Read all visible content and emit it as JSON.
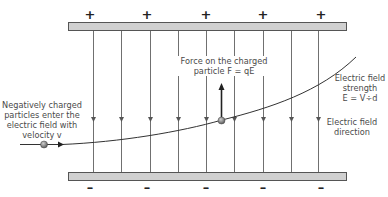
{
  "diagram": {
    "top_plate": {
      "charge_sign": "+",
      "signs": [
        "+",
        "+",
        "+",
        "+",
        "+"
      ],
      "color": "#cfcfcf"
    },
    "bottom_plate": {
      "charge_sign": "–",
      "signs": [
        "–",
        "–",
        "–",
        "–",
        "–"
      ],
      "color": "#cfcfcf"
    },
    "field_lines": {
      "count": 9,
      "direction": "downward"
    },
    "labels": {
      "entry_line1": "Negatively charged",
      "entry_line2": "particles enter the",
      "entry_line3": "electric field with",
      "entry_line4": "velocity v",
      "force_line1": "Force on the charged",
      "force_line2": "particle F = qE",
      "strength_line1": "Electric field",
      "strength_line2": "strength",
      "strength_line3": "E = V÷d",
      "direction_line1": "Electric field",
      "direction_line2": "direction"
    },
    "colors": {
      "field_line": "#6b6b6b",
      "trajectory": "#333333",
      "particle": "#777777",
      "text": "#4a4a4a"
    }
  }
}
